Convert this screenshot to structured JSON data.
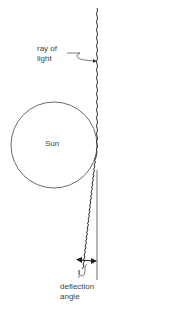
{
  "diagram": {
    "labels": {
      "ray_line1": "ray of",
      "ray_line2": "light",
      "sun": "Sun",
      "angle_line1": "deflection",
      "angle_line2": "angle"
    },
    "colors": {
      "stroke": "#333333",
      "background": "#ffffff",
      "text": "#444444"
    }
  }
}
